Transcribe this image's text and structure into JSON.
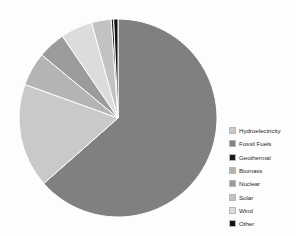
{
  "background_color": "#fdfdfd",
  "chart_data": {
    "type": "pie",
    "title": "",
    "subtitle": "",
    "xlabel": "",
    "ylabel": "",
    "grid": false,
    "legend_position": "right",
    "start_angle_deg": 0,
    "direction": "clockwise",
    "center": {
      "x": 118,
      "y": 118
    },
    "radius": 100,
    "categories": [
      "Hydroelectricity",
      "Fossil Fuels",
      "Geothermal",
      "Biomass",
      "Nuclear",
      "Solar",
      "Wind",
      "Other"
    ],
    "values": [
      17.0,
      63.5,
      0.4,
      5.5,
      4.5,
      3.2,
      5.2,
      0.7
    ],
    "colors": [
      "#c9c9c9",
      "#808080",
      "#1a1a1a",
      "#b4b4b4",
      "#9b9b9b",
      "#c2c2c2",
      "#dcdcdc",
      "#111111"
    ],
    "slice_order_clockwise_from_top": [
      "Fossil Fuels",
      "Hydroelectricity",
      "Biomass",
      "Nuclear",
      "Wind",
      "Solar",
      "Geothermal",
      "Other"
    ],
    "slice_edge_color": "#ffffff",
    "slice_edge_width": 1.0
  },
  "legend": {
    "items": [
      {
        "label": "Hydroelectricity",
        "color": "#c9c9c9"
      },
      {
        "label": "Fossil Fuels",
        "color": "#808080"
      },
      {
        "label": "Geothermal",
        "color": "#1a1a1a"
      },
      {
        "label": "Biomass",
        "color": "#b4b4b4"
      },
      {
        "label": "Nuclear",
        "color": "#9b9b9b"
      },
      {
        "label": "Solar",
        "color": "#c2c2c2"
      },
      {
        "label": "Wind",
        "color": "#dcdcdc"
      },
      {
        "label": "Other",
        "color": "#111111"
      }
    ]
  }
}
